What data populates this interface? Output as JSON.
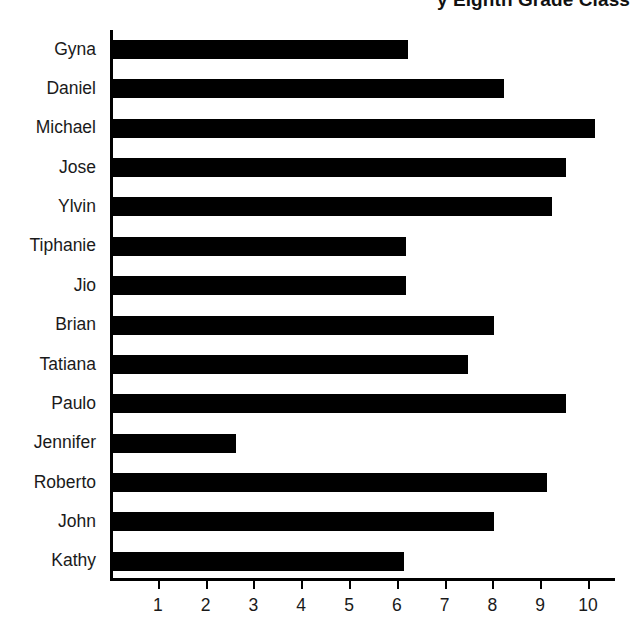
{
  "chart_data": {
    "type": "bar",
    "orientation": "horizontal",
    "title": "y Eighth Grade Class",
    "title_truncated": true,
    "categories": [
      "Gyna",
      "Daniel",
      "Michael",
      "Jose",
      "Ylvin",
      "Tiphanie",
      "Jio",
      "Brian",
      "Tatiana",
      "Paulo",
      "Jennifer",
      "Roberto",
      "John",
      "Kathy"
    ],
    "values": [
      6.2,
      8.2,
      10.1,
      9.5,
      9.2,
      6.15,
      6.15,
      8.0,
      7.45,
      9.5,
      2.6,
      9.1,
      8.0,
      6.1
    ],
    "xlabel": "",
    "ylabel": "",
    "xlim": [
      0,
      10.6
    ],
    "xticks": [
      1,
      2,
      3,
      4,
      5,
      6,
      7,
      8,
      9,
      10
    ],
    "xtick_labels": [
      "1",
      "2",
      "3",
      "4",
      "5",
      "6",
      "7",
      "8",
      "9",
      "10"
    ],
    "grid": false,
    "legend": false,
    "bar_color": "#000000",
    "axis_color": "#000000",
    "background_color": "#ffffff"
  }
}
